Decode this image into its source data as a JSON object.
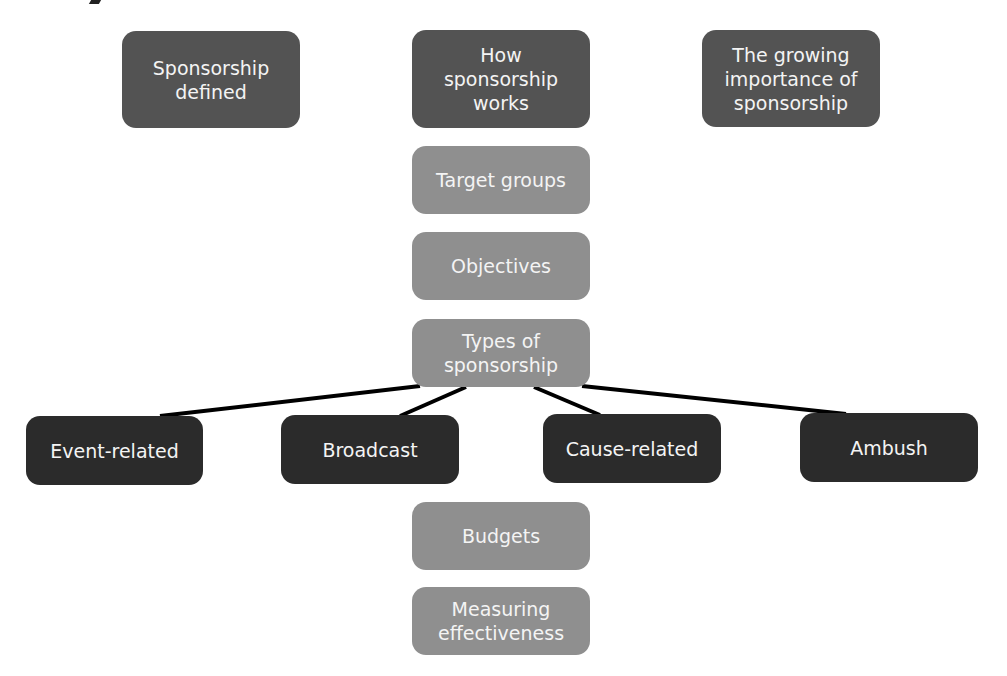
{
  "diagram": {
    "top_row": [
      {
        "id": "sponsorship-defined",
        "label": "Sponsorship\ndefined"
      },
      {
        "id": "how-sponsorship-works",
        "label": "How\nsponsorship\nworks"
      },
      {
        "id": "growing-importance",
        "label": "The growing\nimportance of\nsponsorship"
      }
    ],
    "central_column": [
      {
        "id": "target-groups",
        "label": "Target groups"
      },
      {
        "id": "objectives",
        "label": "Objectives"
      },
      {
        "id": "types-of-sponsorship",
        "label": "Types of\nsponsorship"
      },
      {
        "id": "budgets",
        "label": "Budgets"
      },
      {
        "id": "measuring-effectiveness",
        "label": "Measuring\neffectiveness"
      }
    ],
    "sponsorship_types": [
      {
        "id": "event-related",
        "label": "Event-related"
      },
      {
        "id": "broadcast",
        "label": "Broadcast"
      },
      {
        "id": "cause-related",
        "label": "Cause-related"
      },
      {
        "id": "ambush",
        "label": "Ambush"
      }
    ],
    "colors": {
      "top_row": "#535353",
      "central_column": "#8f8f8f",
      "sponsorship_types": "#2b2b2b",
      "text": "#f4f4f4",
      "connector": "#000000"
    }
  }
}
